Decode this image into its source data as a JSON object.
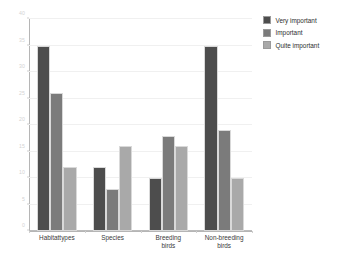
{
  "chart_data": {
    "type": "bar",
    "title": "",
    "subtitle": "",
    "xlabel": "",
    "ylabel": "",
    "categories": [
      "Habitattypes",
      "Species",
      "Breeding\nbirds",
      "Non-breeding\nbirds"
    ],
    "series": [
      {
        "name": "Very important",
        "color": "#4d4d4d",
        "values": [
          35,
          12,
          10,
          35
        ]
      },
      {
        "name": "Important",
        "color": "#7b7b7b",
        "values": [
          26,
          8,
          18,
          19
        ]
      },
      {
        "name": "Quite important",
        "color": "#a9a9a9",
        "values": [
          12,
          16,
          16,
          10
        ]
      }
    ],
    "ylim": [
      0,
      40
    ],
    "ytick_values": [
      0,
      5,
      10,
      15,
      20,
      25,
      30,
      35,
      40
    ],
    "ytick_labels": [
      "0",
      "5",
      "10",
      "15",
      "20",
      "25",
      "30",
      "35",
      "40"
    ],
    "grid": true,
    "grid_axis": "y",
    "legend_position": "right",
    "legend_entries": [
      "Very important",
      "Important",
      "Quite important"
    ],
    "axis_color": "#b5b5b5",
    "grid_color": "#f0f0f0",
    "tick_label_color": "#d3d3d3",
    "category_label_color": "#3a3a3a",
    "background_color": "#ffffff"
  }
}
